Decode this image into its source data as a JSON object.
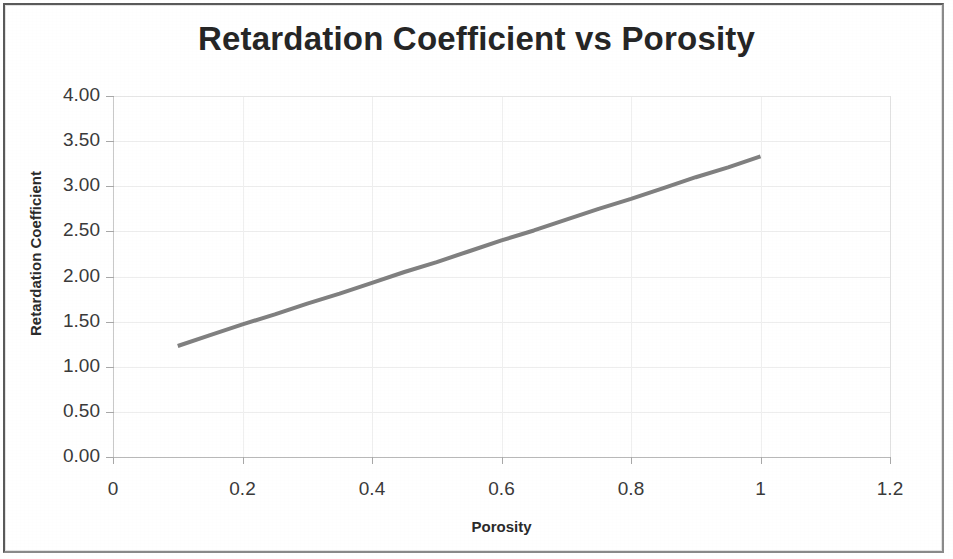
{
  "chart_data": {
    "type": "line",
    "title": "Retardation Coefficient vs Porosity",
    "xlabel": "Porosity",
    "ylabel": "Retardation Coefficient",
    "xlim": [
      0,
      1.2
    ],
    "ylim": [
      0,
      4.0
    ],
    "grid": true,
    "legend": "none",
    "xticks": [
      "0",
      "0.2",
      "0.4",
      "0.6",
      "0.8",
      "1",
      "1.2"
    ],
    "xtick_values": [
      0,
      0.2,
      0.4,
      0.6,
      0.8,
      1,
      1.2
    ],
    "yticks": [
      "0.00",
      "0.50",
      "1.00",
      "1.50",
      "2.00",
      "2.50",
      "3.00",
      "3.50",
      "4.00"
    ],
    "ytick_values": [
      0,
      0.5,
      1.0,
      1.5,
      2.0,
      2.5,
      3.0,
      3.5,
      4.0
    ],
    "series": [
      {
        "name": "Retardation Coefficient",
        "color": "#808080",
        "line_width": 4,
        "x": [
          0.1,
          0.15,
          0.2,
          0.25,
          0.3,
          0.35,
          0.4,
          0.45,
          0.5,
          0.55,
          0.6,
          0.65,
          0.7,
          0.75,
          0.8,
          0.85,
          0.9,
          0.95,
          1.0
        ],
        "values": [
          1.23,
          1.35,
          1.47,
          1.58,
          1.7,
          1.81,
          1.93,
          2.05,
          2.16,
          2.28,
          2.4,
          2.51,
          2.63,
          2.75,
          2.86,
          2.98,
          3.1,
          3.21,
          3.33
        ]
      }
    ]
  },
  "colors": {
    "title": "#262626",
    "axis_text": "#3a3a3a",
    "series": "#808080",
    "grid": "#ededed",
    "frame": "#6e6e6e"
  }
}
